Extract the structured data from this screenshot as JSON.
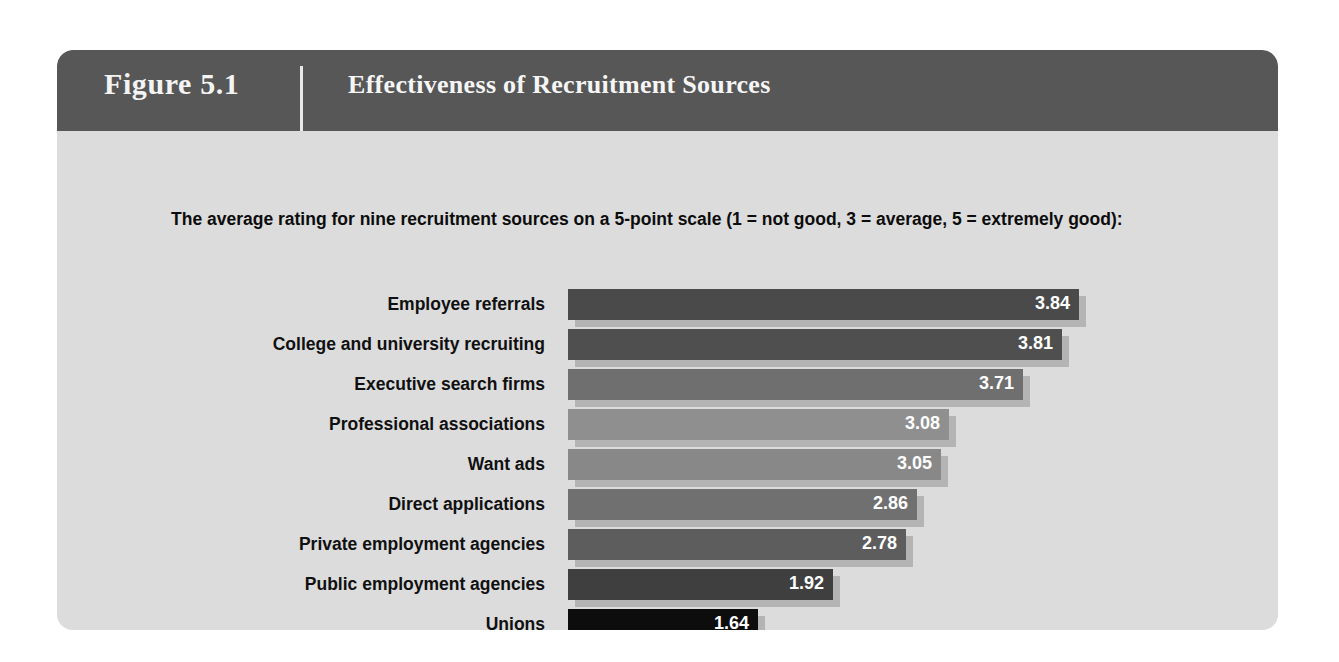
{
  "header": {
    "figure_number": "Figure 5.1",
    "title": "Effectiveness of Recruitment Sources"
  },
  "body": {
    "subtitle": "The average rating for nine recruitment sources on a 5-point scale (1 = not good, 3 = average, 5 = extremely good):"
  },
  "chart_data": {
    "type": "bar",
    "orientation": "horizontal",
    "title": "Effectiveness of Recruitment Sources",
    "subtitle": "The average rating for nine recruitment sources on a 5-point scale (1 = not good, 3 = average, 5 = extremely good):",
    "xlabel": "",
    "ylabel": "",
    "xlim": [
      1.2,
      4.0
    ],
    "grid": false,
    "legend": false,
    "categories": [
      "Employee referrals",
      "College and university recruiting",
      "Executive search firms",
      "Professional associations",
      "Want ads",
      "Direct applications",
      "Private employment agencies",
      "Public employment agencies",
      "Unions"
    ],
    "values": [
      3.84,
      3.81,
      3.71,
      3.08,
      3.05,
      2.86,
      2.78,
      1.92,
      1.64
    ],
    "value_labels": [
      "3.84",
      "3.81",
      "3.71",
      "3.08",
      "3.05",
      "2.86",
      "2.78",
      "1.92",
      "1.64"
    ],
    "bar_colors": [
      "#4a4a4a",
      "#4f4f4f",
      "#6f6f6f",
      "#8f8f8f",
      "#888888",
      "#707070",
      "#5d5d5d",
      "#3f3f3f",
      "#0d0d0d"
    ],
    "bar_pixel_widths": [
      511,
      494,
      455,
      381,
      373,
      349,
      338,
      265,
      190
    ],
    "shadow_color": "#b4b4b4"
  },
  "colors": {
    "header_bar": "#575757",
    "panel_body": "#dcdcdc",
    "page_background": "#ffffff",
    "header_text": "#f4f4f4",
    "label_text": "#101010",
    "value_text": "#ffffff"
  }
}
